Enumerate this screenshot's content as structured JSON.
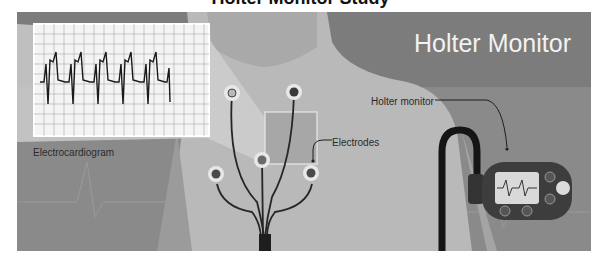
{
  "header": {
    "cut_title": "Holter Monitor Study"
  },
  "illustration": {
    "title": "Holter Monitor",
    "labels": {
      "ecg": "Electrocardiogram",
      "electrodes": "Electrodes",
      "holter": "Holter monitor"
    },
    "colors": {
      "background": "#8a8a8a",
      "banner": "#7a7a7a",
      "body": "#b9b9b9",
      "body_light": "#cfcfcf",
      "cable": "#1e1e1e",
      "device": "#3d3d3d",
      "screen": "#d9d9d9",
      "title_text": "#f2f2f2"
    },
    "electrodes_count": 6,
    "device_buttons_count": 5
  }
}
